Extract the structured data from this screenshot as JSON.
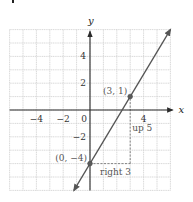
{
  "chart_data": {
    "type": "line",
    "title": "",
    "xlabel": "x",
    "ylabel": "y",
    "xlim": [
      -6,
      6
    ],
    "ylim": [
      -6,
      6
    ],
    "grid": true,
    "x_ticks": [
      {
        "value": -4,
        "label": "−4"
      },
      {
        "value": -2,
        "label": "−2"
      },
      {
        "value": 0,
        "label": "0"
      },
      {
        "value": 4,
        "label": "4"
      }
    ],
    "y_ticks": [
      {
        "value": 4,
        "label": "4"
      },
      {
        "value": 2,
        "label": "2"
      },
      {
        "value": -2,
        "label": "−2"
      }
    ],
    "series": [
      {
        "name": "line",
        "slope": 1.6667,
        "intercept": -4,
        "x_range": [
          -1.2,
          6
        ],
        "arrows": "both"
      }
    ],
    "points": [
      {
        "x": 0,
        "y": -4,
        "label": "(0, −4)"
      },
      {
        "x": 3,
        "y": 1,
        "label": "(3, 1)"
      }
    ],
    "annotations": [
      {
        "text": "right 3",
        "kind": "run",
        "from": [
          0,
          -4
        ],
        "to": [
          3,
          -4
        ]
      },
      {
        "text": "up 5",
        "kind": "rise",
        "from": [
          3,
          -4
        ],
        "to": [
          3,
          1
        ]
      }
    ],
    "colors": {
      "line": "#555555",
      "grid": "#cfcfcf",
      "axis": "#2b2b2b",
      "label": "#555555"
    }
  }
}
